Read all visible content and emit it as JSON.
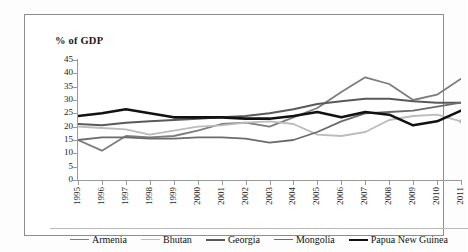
{
  "chart_data": {
    "type": "line",
    "title": "",
    "ylabel": "% of GDP",
    "xlabel": "",
    "ylim": [
      0,
      45
    ],
    "ytick_step": 5,
    "yticks": [
      0,
      5,
      10,
      15,
      20,
      25,
      30,
      35,
      40,
      45
    ],
    "grid": false,
    "legend_position": "bottom",
    "x": [
      1995,
      1996,
      1997,
      1998,
      1999,
      2000,
      2001,
      2002,
      2003,
      2004,
      2005,
      2006,
      2007,
      2008,
      2009,
      2010,
      2011
    ],
    "categories": [
      "1995",
      "1996",
      "1997",
      "1998",
      "1999",
      "2000",
      "2001",
      "2002",
      "2003",
      "2004",
      "2005",
      "2006",
      "2007",
      "2008",
      "2009",
      "2010",
      "2011"
    ],
    "series": [
      {
        "name": "Armenia",
        "color": "#7d7d7d",
        "width": 1.8,
        "values": [
          15.0,
          11.0,
          16.5,
          16.0,
          16.5,
          18.5,
          21.0,
          21.5,
          20.0,
          23.5,
          27.0,
          33.0,
          38.5,
          36.0,
          30.0,
          32.0,
          38.0
        ]
      },
      {
        "name": "Bhutan",
        "color": "#bcbcbc",
        "width": 1.8,
        "values": [
          20.0,
          19.5,
          19.0,
          17.0,
          18.5,
          20.0,
          20.5,
          21.5,
          22.0,
          21.0,
          17.0,
          16.5,
          18.0,
          22.5,
          24.0,
          24.5,
          22.0
        ],
        "end_marker": true
      },
      {
        "name": "Georgia",
        "color": "#5a5a5a",
        "width": 2.0,
        "values": [
          21.0,
          20.5,
          21.5,
          22.0,
          22.5,
          23.0,
          23.5,
          24.0,
          25.0,
          26.5,
          28.5,
          29.5,
          30.5,
          30.5,
          29.5,
          29.0,
          29.0
        ]
      },
      {
        "name": "Mongolia",
        "color": "#6b6b6b",
        "width": 1.8,
        "values": [
          15.0,
          16.0,
          16.0,
          15.5,
          15.5,
          16.0,
          16.0,
          15.5,
          14.0,
          15.0,
          18.0,
          22.0,
          25.0,
          25.5,
          26.0,
          27.5,
          29.0
        ]
      },
      {
        "name": "Papua New Guinea",
        "color": "#111111",
        "width": 2.6,
        "values": [
          24.0,
          25.0,
          26.5,
          25.0,
          23.5,
          23.5,
          23.5,
          23.0,
          23.0,
          24.0,
          25.5,
          23.5,
          25.5,
          24.5,
          20.5,
          22.0,
          26.0
        ]
      }
    ]
  },
  "legend": {
    "items": [
      {
        "label": "Armenia"
      },
      {
        "label": "Bhutan"
      },
      {
        "label": "Georgia"
      },
      {
        "label": "Mongolia"
      },
      {
        "label": "Papua New Guinea"
      }
    ]
  }
}
